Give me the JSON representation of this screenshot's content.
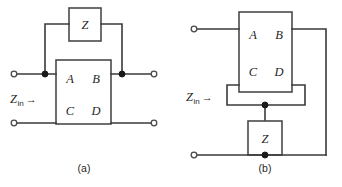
{
  "figure": {
    "background_color": "#ffffff",
    "line_color": "#3a3a3a",
    "text_color": "#1f1f1f",
    "panels": [
      {
        "id": "a",
        "caption": "(a)",
        "input_label_main": "Z",
        "input_label_sub": "in",
        "input_label_arrow": "→",
        "network_box": {
          "name": "abcd-two-port",
          "params": [
            "A",
            "B",
            "C",
            "D"
          ]
        },
        "shunt_box": {
          "name": "z-element",
          "label": "Z"
        },
        "terminals": {
          "left_top": "open",
          "left_bottom": "open",
          "right_top": "open",
          "right_bottom": "open"
        },
        "junction_dots": 2
      },
      {
        "id": "b",
        "caption": "(b)",
        "input_label_main": "Z",
        "input_label_sub": "in",
        "input_label_arrow": "→",
        "network_box": {
          "name": "abcd-two-port",
          "params": [
            "A",
            "B",
            "C",
            "D"
          ]
        },
        "shunt_box": {
          "name": "z-element",
          "label": "Z"
        },
        "terminals": {
          "left_top": "open",
          "left_bottom": "open"
        },
        "junction_dots": 2
      }
    ]
  }
}
